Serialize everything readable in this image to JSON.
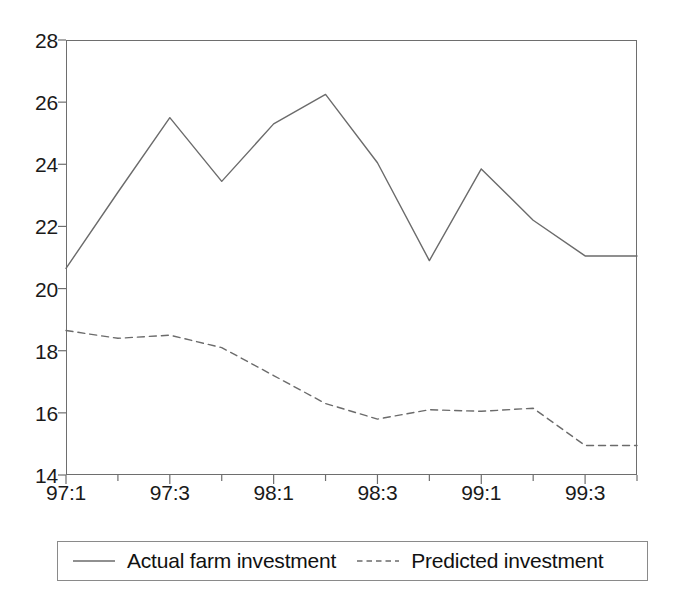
{
  "chart_data": {
    "type": "line",
    "title": "",
    "subtitle": "",
    "xlabel": "",
    "ylabel": "",
    "ylim": [
      14,
      28
    ],
    "y_ticks": [
      14,
      16,
      18,
      20,
      22,
      24,
      26,
      28
    ],
    "y_tick_labels": [
      "14",
      "16",
      "18",
      "20",
      "22",
      "24",
      "26",
      "28"
    ],
    "grid": false,
    "legend_position": "bottom",
    "x": [
      "97:1",
      "97:2",
      "97:3",
      "97:4",
      "98:1",
      "98:2",
      "98:3",
      "98:4",
      "99:1",
      "99:2",
      "99:3",
      "99:4"
    ],
    "x_tick_labels_shown": [
      "97:1",
      "97:3",
      "98:1",
      "98:3",
      "99:1",
      "99:3"
    ],
    "series": [
      {
        "name": "Actual farm investment",
        "style": "solid",
        "color": "#6b6b6b",
        "values": [
          20.65,
          23.1,
          25.5,
          23.45,
          25.3,
          26.25,
          24.05,
          20.9,
          23.85,
          22.2,
          21.05,
          21.05
        ]
      },
      {
        "name": "Predicted investment",
        "style": "dashed",
        "color": "#6b6b6b",
        "values": [
          18.65,
          18.4,
          18.5,
          18.1,
          17.2,
          16.3,
          15.8,
          16.1,
          16.05,
          16.15,
          14.95,
          14.95
        ]
      }
    ]
  },
  "legend": {
    "entries": [
      {
        "label": "Actual farm investment",
        "style": "solid"
      },
      {
        "label": "Predicted investment",
        "style": "dashed"
      }
    ]
  },
  "style": {
    "axis_color": "#6e6e6e",
    "line_color": "#6b6b6b",
    "text_color": "#1a1a1a",
    "background": "#ffffff",
    "legend_border": "#8a8a8a"
  }
}
